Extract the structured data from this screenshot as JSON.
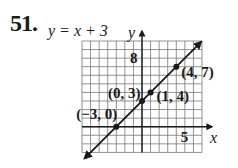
{
  "problem": {
    "number": "51.",
    "equation": "y = x + 3"
  },
  "chart_data": {
    "type": "line",
    "title": "y = x + 3",
    "xlabel": "x",
    "ylabel": "y",
    "xlim": [
      -7,
      7
    ],
    "ylim": [
      -3,
      10
    ],
    "grid": true,
    "tick_labels": {
      "x": [
        {
          "value": 5,
          "label": "5"
        }
      ],
      "y": [
        {
          "value": 8,
          "label": "8"
        }
      ]
    },
    "series": [
      {
        "name": "y = x + 3",
        "slope": 1,
        "intercept": 3,
        "points": [
          {
            "x": -3,
            "y": 0,
            "label": "(−3, 0)"
          },
          {
            "x": 0,
            "y": 3,
            "label": "(0, 3)"
          },
          {
            "x": 1,
            "y": 4,
            "label": "(1, 4)"
          },
          {
            "x": 4,
            "y": 7,
            "label": "(4, 7)"
          }
        ]
      }
    ]
  }
}
